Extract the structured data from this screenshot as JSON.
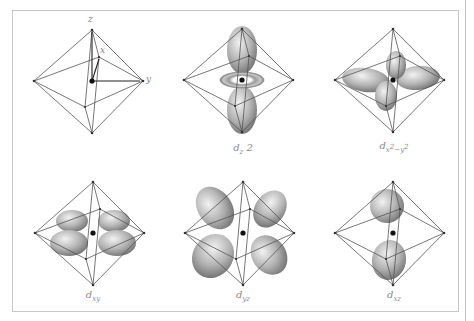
{
  "figure": {
    "panels": [
      {
        "id": "axes",
        "label": "",
        "axes": {
          "z": "z",
          "x": "x",
          "y": "y"
        }
      },
      {
        "id": "dz2",
        "label_main": "d",
        "label_sub": "z",
        "label_tail": " 2"
      },
      {
        "id": "dx2y2",
        "label_main": "d",
        "label_sub": "x",
        "label_sup1": "2",
        "label_mid": "−y",
        "label_sup2": "2"
      },
      {
        "id": "dxy",
        "label_main": "d",
        "label_sub": "xy"
      },
      {
        "id": "dyz",
        "label_main": "d",
        "label_sub": "yz"
      },
      {
        "id": "dxz",
        "label_main": "d",
        "label_sub": "xz"
      }
    ]
  },
  "colors": {
    "frame": "#c8c8c8",
    "edge": "#555555",
    "lobe_light": "#e4e4e4",
    "lobe_dark": "#7a7a7a",
    "label": "#8a8a8a"
  }
}
